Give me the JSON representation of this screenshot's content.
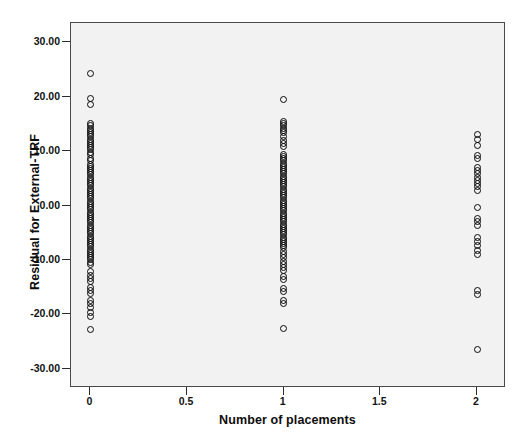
{
  "chart_data": {
    "type": "scatter",
    "title": "",
    "xlabel": "Number of placements",
    "ylabel": "Residual for External-TRF",
    "xlim": [
      -0.1,
      2.15
    ],
    "ylim": [
      -33.5,
      33.5
    ],
    "xticks": [
      0,
      0.5,
      1,
      1.5,
      2
    ],
    "xticklabels": [
      "0",
      "0.5",
      "1",
      "1.5",
      "2"
    ],
    "yticks": [
      30,
      20,
      10,
      0,
      -10,
      -20,
      -30
    ],
    "yticklabels": [
      "30.00",
      "20.00",
      "10.00",
      "0.00",
      "-10.00",
      "-20.00",
      "-30.00"
    ],
    "grid": false,
    "legend": null,
    "marker": "open-circle",
    "marker_color": "#0a0a0a",
    "plot_background": "#f2f2f2",
    "frame_color": "#4a4a4a",
    "series": [
      {
        "name": "Number of placements = 0",
        "x": 0,
        "values": [
          24.2,
          19.6,
          18.6,
          15.0,
          14.6,
          14.2,
          13.8,
          13.4,
          13.0,
          12.6,
          12.2,
          11.8,
          11.4,
          11.0,
          10.6,
          10.2,
          9.8,
          9.4,
          8.6,
          8.2,
          7.6,
          7.2,
          6.8,
          6.4,
          6.0,
          5.6,
          5.2,
          4.8,
          4.4,
          4.0,
          3.6,
          3.2,
          2.8,
          2.4,
          2.0,
          1.6,
          1.2,
          0.8,
          0.4,
          0.0,
          -0.4,
          -0.8,
          -1.2,
          -1.6,
          -2.0,
          -2.4,
          -2.8,
          -3.2,
          -3.6,
          -4.0,
          -4.4,
          -4.8,
          -5.2,
          -5.6,
          -6.0,
          -6.4,
          -6.8,
          -7.2,
          -7.6,
          -8.0,
          -8.4,
          -8.8,
          -9.2,
          -9.6,
          -10.0,
          -10.4,
          -10.8,
          -12.2,
          -12.8,
          -13.4,
          -14.0,
          -15.0,
          -15.6,
          -16.2,
          -17.4,
          -18.0,
          -18.8,
          -19.6,
          -20.4,
          -22.8
        ]
      },
      {
        "name": "Number of placements = 1",
        "x": 1,
        "values": [
          19.5,
          15.4,
          15.0,
          14.6,
          14.2,
          13.8,
          13.4,
          12.6,
          12.0,
          11.4,
          10.8,
          9.4,
          9.0,
          8.6,
          8.2,
          7.8,
          7.4,
          7.0,
          6.6,
          6.2,
          5.8,
          5.4,
          5.0,
          4.6,
          4.2,
          3.8,
          3.4,
          3.0,
          2.6,
          2.2,
          1.8,
          1.4,
          1.0,
          0.6,
          0.2,
          -0.2,
          -0.6,
          -1.0,
          -1.4,
          -1.8,
          -2.2,
          -2.6,
          -3.0,
          -3.4,
          -3.8,
          -4.2,
          -4.6,
          -5.0,
          -5.4,
          -5.8,
          -6.2,
          -6.6,
          -7.0,
          -7.4,
          -7.8,
          -8.4,
          -9.0,
          -9.6,
          -10.2,
          -10.8,
          -11.4,
          -12.0,
          -13.0,
          -13.6,
          -15.2,
          -15.8,
          -17.4,
          -18.0,
          -22.5
        ]
      },
      {
        "name": "Number of placements = 2",
        "x": 2,
        "values": [
          13.0,
          12.2,
          11.0,
          9.2,
          8.6,
          7.0,
          6.4,
          5.8,
          5.2,
          4.6,
          4.0,
          3.4,
          2.8,
          -0.4,
          -2.4,
          -3.0,
          -3.6,
          -5.8,
          -6.6,
          -7.4,
          -8.2,
          -9.0,
          -15.6,
          -16.4,
          -26.5
        ]
      }
    ]
  }
}
